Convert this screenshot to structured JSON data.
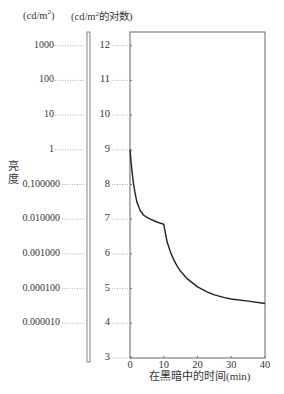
{
  "chart_data": {
    "type": "line",
    "title": "",
    "xlabel": "在黑暗中的时间(min)",
    "ylabel": "亮度",
    "y_units_left": "(cd/m²)",
    "y_units_right": "(cd/m²的对数)",
    "xlim": [
      0,
      40
    ],
    "ylim": [
      3,
      12.5
    ],
    "x_ticks": [
      "0",
      "10",
      "20",
      "30",
      "40"
    ],
    "y_ticks_log": [
      "12",
      "11",
      "10",
      "9",
      "8",
      "7",
      "6",
      "5",
      "4",
      "3"
    ],
    "y_ticks_luminance": [
      "1000",
      "100",
      "10",
      "1",
      "0.100000",
      "0.010000",
      "0.001000",
      "0.000100",
      "0.000010"
    ],
    "grid": false,
    "legend": null,
    "series": [
      {
        "name": "暗适应曲线",
        "x": [
          0,
          0.5,
          1,
          1.5,
          2,
          3,
          4,
          5,
          6,
          8,
          10,
          10.5,
          11,
          12,
          13,
          14,
          15,
          17,
          20,
          23,
          25,
          28,
          30,
          35,
          40
        ],
        "y": [
          9.0,
          8.45,
          8.05,
          7.75,
          7.5,
          7.25,
          7.12,
          7.05,
          7.0,
          6.92,
          6.85,
          6.6,
          6.35,
          6.05,
          5.82,
          5.64,
          5.5,
          5.28,
          5.05,
          4.9,
          4.82,
          4.74,
          4.7,
          4.64,
          4.57
        ]
      }
    ]
  },
  "labels": {
    "unit_left": "(cd/m",
    "unit_left_sup": "2",
    "unit_left_end": ")",
    "unit_right": "(cd/m",
    "unit_right_sup": "2",
    "unit_right_end": "的对数)",
    "y_title": "亮度",
    "x_title": "在黑暗中的时间(min)"
  }
}
